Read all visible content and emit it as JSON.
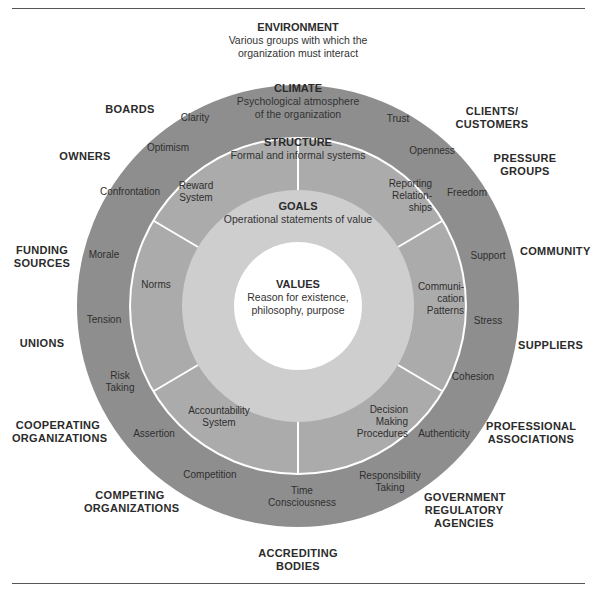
{
  "colors": {
    "climate_ring": "#8e8e8e",
    "structure_ring": "#ababab",
    "goals_ring": "#cecece",
    "values_core": "#ffffff",
    "divider": "#ffffff",
    "text": "#2b2b2b"
  },
  "environment": {
    "title": "ENVIRONMENT",
    "subtitle_line1": "Various groups with which the",
    "subtitle_line2": "organization must interact",
    "groups": [
      {
        "lines": [
          "BOARDS"
        ]
      },
      {
        "lines": [
          "OWNERS"
        ]
      },
      {
        "lines": [
          "FUNDING",
          "SOURCES"
        ]
      },
      {
        "lines": [
          "UNIONS"
        ]
      },
      {
        "lines": [
          "COOPERATING",
          "ORGANIZATIONS"
        ]
      },
      {
        "lines": [
          "COMPETING",
          "ORGANIZATIONS"
        ]
      },
      {
        "lines": [
          "ACCREDITING",
          "BODIES"
        ]
      },
      {
        "lines": [
          "GOVERNMENT",
          "REGULATORY",
          "AGENCIES"
        ]
      },
      {
        "lines": [
          "PROFESSIONAL",
          "ASSOCIATIONS"
        ]
      },
      {
        "lines": [
          "SUPPLIERS"
        ]
      },
      {
        "lines": [
          "COMMUNITY"
        ]
      },
      {
        "lines": [
          "PRESSURE",
          "GROUPS"
        ]
      },
      {
        "lines": [
          "CLIENTS/",
          "CUSTOMERS"
        ]
      }
    ]
  },
  "climate": {
    "title": "CLIMATE",
    "subtitle_line1": "Psychological atmosphere",
    "subtitle_line2": "of the organization",
    "items": [
      {
        "lines": [
          "Clarity"
        ]
      },
      {
        "lines": [
          "Optimism"
        ]
      },
      {
        "lines": [
          "Confrontation"
        ]
      },
      {
        "lines": [
          "Morale"
        ]
      },
      {
        "lines": [
          "Tension"
        ]
      },
      {
        "lines": [
          "Risk",
          "Taking"
        ]
      },
      {
        "lines": [
          "Assertion"
        ]
      },
      {
        "lines": [
          "Competition"
        ]
      },
      {
        "lines": [
          "Time",
          "Consciousness"
        ]
      },
      {
        "lines": [
          "Responsibility",
          "Taking"
        ]
      },
      {
        "lines": [
          "Authenticity"
        ]
      },
      {
        "lines": [
          "Cohesion"
        ]
      },
      {
        "lines": [
          "Stress"
        ]
      },
      {
        "lines": [
          "Support"
        ]
      },
      {
        "lines": [
          "Freedom"
        ]
      },
      {
        "lines": [
          "Openness"
        ]
      },
      {
        "lines": [
          "Trust"
        ]
      }
    ]
  },
  "structure": {
    "title": "STRUCTURE",
    "subtitle": "Formal and informal systems",
    "items": [
      {
        "lines": [
          "Reward",
          "System"
        ]
      },
      {
        "lines": [
          "Norms"
        ]
      },
      {
        "lines": [
          "Accountability",
          "System"
        ]
      },
      {
        "lines": [
          "Decision",
          "Making",
          "Procedures"
        ]
      },
      {
        "lines": [
          "Communi-",
          "cation",
          "Patterns"
        ]
      },
      {
        "lines": [
          "Reporting",
          "Relation-",
          "ships"
        ]
      }
    ]
  },
  "goals": {
    "title": "GOALS",
    "subtitle": "Operational statements of value"
  },
  "values": {
    "title": "VALUES",
    "subtitle_line1": "Reason for existence,",
    "subtitle_line2": "philosophy, purpose"
  }
}
